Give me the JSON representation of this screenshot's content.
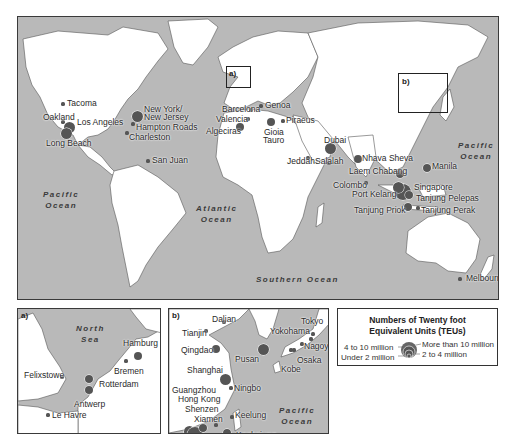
{
  "main_map": {
    "oceans": [
      {
        "name": "Pacific\nOcean",
        "line1": "Pacific",
        "line2": "Ocean",
        "x": 45,
        "y": 200
      },
      {
        "name": "Atlantic Ocean",
        "line1": "Atlantic",
        "line2": "Ocean",
        "x": 195,
        "y": 200
      },
      {
        "name": "Southern Ocean",
        "line1": "Southern   Ocean",
        "line2": "",
        "x": 255,
        "y": 275
      },
      {
        "name": "Pacific Ocean",
        "line1": "Pacific",
        "line2": "Ocean",
        "x": 455,
        "y": 141
      }
    ],
    "inset_markers": [
      {
        "label": "a)",
        "x": 225,
        "y": 65,
        "w": 25,
        "h": 22
      },
      {
        "label": "b)",
        "x": 397,
        "y": 98,
        "w": 50,
        "h": 40
      }
    ],
    "ports": [
      {
        "name": "Tacoma",
        "x": 45,
        "y": 87,
        "size": "under2",
        "lx": 49,
        "ly": 82
      },
      {
        "name": "Oakland",
        "x": 45,
        "y": 105,
        "size": "under2",
        "lx": 25,
        "ly": 96
      },
      {
        "name": "Los Angeles",
        "x": 51,
        "y": 110,
        "size": "4to10",
        "lx": 59,
        "ly": 101
      },
      {
        "name": "Long Beach",
        "x": 48,
        "y": 116,
        "size": "4to10",
        "lx": 28,
        "ly": 122
      },
      {
        "name": "New York/\nNew Jersey",
        "x": 119,
        "y": 99,
        "size": "4to10",
        "lx": 126,
        "ly": 88
      },
      {
        "name": "New Jersey",
        "x": 119,
        "y": 99,
        "size": "none",
        "lx": 126,
        "ly": 96
      },
      {
        "name": "Hampton Roads",
        "x": 115,
        "y": 107,
        "size": "under2",
        "lx": 118,
        "ly": 106
      },
      {
        "name": "Charleston",
        "x": 109,
        "y": 116,
        "size": "under2",
        "lx": 111,
        "ly": 116
      },
      {
        "name": "San Juan",
        "x": 130,
        "y": 144,
        "size": "under2",
        "lx": 134,
        "ly": 139
      },
      {
        "name": "Barcelona",
        "x": 233,
        "y": 93,
        "size": "under2",
        "lx": 204,
        "ly": 88
      },
      {
        "name": "Genoa",
        "x": 243,
        "y": 89,
        "size": "under2",
        "lx": 247,
        "ly": 84
      },
      {
        "name": "Valencia",
        "x": 230,
        "y": 102,
        "size": "under2",
        "lx": 198,
        "ly": 98
      },
      {
        "name": "Algeciras",
        "x": 222,
        "y": 110,
        "size": "2to4",
        "lx": 188,
        "ly": 110
      },
      {
        "name": "Gioia",
        "x": 253,
        "y": 105,
        "size": "2to4",
        "lx": 246,
        "ly": 111
      },
      {
        "name": "Tauro",
        "x": 253,
        "y": 105,
        "size": "none",
        "lx": 245,
        "ly": 119
      },
      {
        "name": "Piraeus",
        "x": 265,
        "y": 104,
        "size": "under2",
        "lx": 268,
        "ly": 99
      },
      {
        "name": "Dubai",
        "x": 312,
        "y": 131,
        "size": "4to10",
        "lx": 306,
        "ly": 119
      },
      {
        "name": "Jeddah",
        "x": 290,
        "y": 141,
        "size": "under2",
        "lx": 269,
        "ly": 140
      },
      {
        "name": "Salalah",
        "x": 311,
        "y": 146,
        "size": "under2",
        "lx": 297,
        "ly": 140
      },
      {
        "name": "Nhava Sheva",
        "x": 340,
        "y": 142,
        "size": "2to4",
        "lx": 344,
        "ly": 137
      },
      {
        "name": "Laem Chabang",
        "x": 382,
        "y": 157,
        "size": "2to4",
        "lx": 331,
        "ly": 150
      },
      {
        "name": "Colombo",
        "x": 348,
        "y": 166,
        "size": "under2",
        "lx": 315,
        "ly": 164
      },
      {
        "name": "Manila",
        "x": 409,
        "y": 151,
        "size": "2to4",
        "lx": 414,
        "ly": 145
      },
      {
        "name": "Singapore",
        "x": 385,
        "y": 175,
        "size": "over10",
        "lx": 396,
        "ly": 166
      },
      {
        "name": "Port Kelang",
        "x": 380,
        "y": 170,
        "size": "4to10",
        "lx": 334,
        "ly": 173
      },
      {
        "name": "Tanjung Pelepas",
        "x": 391,
        "y": 178,
        "size": "2to4",
        "lx": 398,
        "ly": 177
      },
      {
        "name": "Tanjung Priok",
        "x": 390,
        "y": 190,
        "size": "2to4",
        "lx": 336,
        "ly": 189
      },
      {
        "name": "Tanjung Perak",
        "x": 400,
        "y": 191,
        "size": "under2",
        "lx": 403,
        "ly": 189
      },
      {
        "name": "Melbourne",
        "x": 442,
        "y": 262,
        "size": "under2",
        "lx": 448,
        "ly": 257
      }
    ]
  },
  "inset_a": {
    "tag": "a)",
    "ocean": {
      "line1": "North",
      "line2": "Sea"
    },
    "ports": [
      {
        "name": "Hamburg",
        "x": 120,
        "y": 47,
        "size": "2to4",
        "lx": 105,
        "ly": 30
      },
      {
        "name": "Bremen",
        "x": 108,
        "y": 52,
        "size": "under2",
        "lx": 96,
        "ly": 58
      },
      {
        "name": "Felixstowe",
        "x": 44,
        "y": 68,
        "size": "under2",
        "lx": 6,
        "ly": 62
      },
      {
        "name": "Rotterdam",
        "x": 71,
        "y": 70,
        "size": "2to4",
        "lx": 81,
        "ly": 71
      },
      {
        "name": "Antwerp",
        "x": 71,
        "y": 81,
        "size": "2to4",
        "lx": 56,
        "ly": 91
      },
      {
        "name": "Le Havre",
        "x": 30,
        "y": 106,
        "size": "under2",
        "lx": 34,
        "ly": 102
      }
    ]
  },
  "inset_b": {
    "tag": "b)",
    "ocean": {
      "line1": "Pacific",
      "line2": "Ocean"
    },
    "ports": [
      {
        "name": "Dalian",
        "x": 55,
        "y": 13,
        "size": "under2",
        "lx": 43,
        "ly": 6
      },
      {
        "name": "Tianjin",
        "x": 37,
        "y": 22,
        "size": "under2",
        "lx": 13,
        "ly": 20
      },
      {
        "name": "Qingdao",
        "x": 47,
        "y": 40,
        "size": "2to4",
        "lx": 12,
        "ly": 37
      },
      {
        "name": "Pusan",
        "x": 94,
        "y": 40,
        "size": "4to10",
        "lx": 66,
        "ly": 46
      },
      {
        "name": "Tokyo",
        "x": 144,
        "y": 25,
        "size": "under2",
        "lx": 132,
        "ly": 8
      },
      {
        "name": "Yokohama",
        "x": 142,
        "y": 30,
        "size": "under2",
        "lx": 101,
        "ly": 18
      },
      {
        "name": "Nagoya",
        "x": 133,
        "y": 35,
        "size": "under2",
        "lx": 135,
        "ly": 33
      },
      {
        "name": "Osaka",
        "x": 125,
        "y": 41,
        "size": "under2",
        "lx": 128,
        "ly": 47
      },
      {
        "name": "Kobe",
        "x": 122,
        "y": 41,
        "size": "under2",
        "lx": 112,
        "ly": 56
      },
      {
        "name": "Shanghai",
        "x": 56,
        "y": 70,
        "size": "4to10",
        "lx": 18,
        "ly": 57
      },
      {
        "name": "Ningbo",
        "x": 62,
        "y": 79,
        "size": "under2",
        "lx": 65,
        "ly": 75
      },
      {
        "name": "Guangzhou",
        "x": 20,
        "y": 122,
        "size": "4to10",
        "lx": 3,
        "ly": 77
      },
      {
        "name": "Hong Kong",
        "x": 26,
        "y": 126,
        "size": "over10",
        "lx": 9,
        "ly": 86
      },
      {
        "name": "Shenzen",
        "x": 34,
        "y": 119,
        "size": "2to4",
        "lx": 16,
        "ly": 96
      },
      {
        "name": "Xiamen",
        "x": 47,
        "y": 116,
        "size": "under2",
        "lx": 25,
        "ly": 106
      },
      {
        "name": "Keelung",
        "x": 63,
        "y": 108,
        "size": "under2",
        "lx": 66,
        "ly": 102
      },
      {
        "name": "Kaohsiung",
        "x": 58,
        "y": 124,
        "size": "2to4",
        "lx": 67,
        "ly": 122
      }
    ]
  },
  "legend": {
    "title_line1": "Numbers of Twenty foot",
    "title_line2": "Equivalent Units (TEUs)",
    "items": [
      {
        "label": "More than 10 million",
        "size": "over10"
      },
      {
        "label": "4 to 10 million",
        "size": "4to10"
      },
      {
        "label": "2 to 4 million",
        "size": "2to4"
      },
      {
        "label": "Under 2 million",
        "size": "under2"
      }
    ]
  },
  "colors": {
    "sea": "#b9b9b9",
    "land": "#ffffff",
    "port": "#555555",
    "border": "#3a3a3a"
  }
}
